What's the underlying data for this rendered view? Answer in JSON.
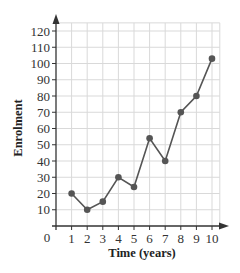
{
  "chart_data": {
    "type": "line",
    "title": "",
    "xlabel": "Time (years)",
    "ylabel": "Enrolment",
    "x": [
      1,
      2,
      3,
      4,
      5,
      6,
      7,
      8,
      9,
      10
    ],
    "values": [
      20,
      10,
      15,
      30,
      24,
      54,
      40,
      70,
      80,
      103
    ],
    "xticks": [
      1,
      2,
      3,
      4,
      5,
      6,
      7,
      8,
      9,
      10
    ],
    "yticks": [
      10,
      20,
      30,
      40,
      50,
      60,
      70,
      80,
      90,
      100,
      110,
      120
    ],
    "origin_label": "0",
    "xlim": [
      0,
      10.5
    ],
    "ylim": [
      0,
      125
    ],
    "grid": true,
    "legend": "none",
    "colors": {
      "line": "#555555",
      "marker": "#555555",
      "grid": "#d9d9d9",
      "axis": "#333333"
    }
  }
}
